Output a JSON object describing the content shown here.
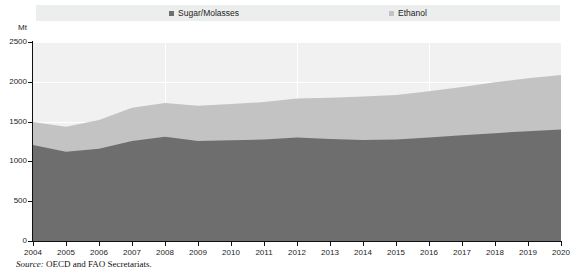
{
  "legend": {
    "position": "top",
    "entries": [
      {
        "label": "Sugar/Molasses",
        "color": "#6e6e6e",
        "icon": "square-swatch-icon"
      },
      {
        "label": "Ethanol",
        "color": "#c3c3c3",
        "icon": "square-swatch-icon"
      }
    ]
  },
  "axis": {
    "unit": "Mt",
    "y_ticks": [
      "2500",
      "2000",
      "1500",
      "1000",
      "500",
      "0"
    ],
    "x_ticks": [
      "2004",
      "2005",
      "2006",
      "2007",
      "2008",
      "2009",
      "2010",
      "2011",
      "2012",
      "2013",
      "2014",
      "2015",
      "2016",
      "2017",
      "2018",
      "2019",
      "2020"
    ]
  },
  "source": {
    "prefix": "Source:",
    "text": "OECD and FAO Secretariats."
  },
  "chart_data": {
    "type": "area",
    "stacked": true,
    "title": "",
    "subtitle": "",
    "xlabel": "",
    "ylabel": "Mt",
    "ylim": [
      0,
      2500
    ],
    "ytick_values": [
      0,
      500,
      1000,
      1500,
      2000,
      2500
    ],
    "grid": "horizontal-and-vertical-white",
    "legend_position": "top",
    "categories": [
      2004,
      2005,
      2006,
      2007,
      2008,
      2009,
      2010,
      2011,
      2012,
      2013,
      2014,
      2015,
      2016,
      2017,
      2018,
      2019,
      2020
    ],
    "series": [
      {
        "name": "Sugar/Molasses",
        "color": "#6e6e6e",
        "values": [
          1205,
          1120,
          1160,
          1255,
          1310,
          1255,
          1265,
          1275,
          1300,
          1280,
          1270,
          1275,
          1300,
          1330,
          1355,
          1380,
          1400
        ]
      },
      {
        "name": "Ethanol",
        "color": "#c3c3c3",
        "values": [
          290,
          315,
          360,
          420,
          425,
          445,
          455,
          470,
          490,
          520,
          545,
          560,
          580,
          605,
          640,
          665,
          685
        ]
      }
    ],
    "totals": [
      1495,
      1435,
      1520,
      1675,
      1735,
      1700,
      1720,
      1745,
      1790,
      1800,
      1815,
      1835,
      1880,
      1935,
      1995,
      2045,
      2085
    ]
  }
}
